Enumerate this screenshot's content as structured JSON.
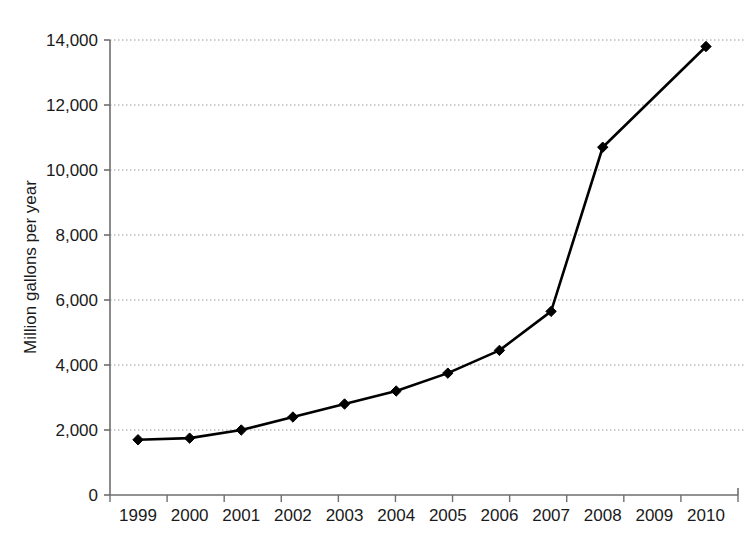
{
  "chart_data": {
    "type": "line",
    "title": "",
    "subtitle": "",
    "xlabel": "",
    "ylabel": "Million gallons per year",
    "categories": [
      "1999",
      "2000",
      "2001",
      "2002",
      "2003",
      "2004",
      "2005",
      "2006",
      "2007",
      "2008",
      "2009",
      "2010"
    ],
    "values": [
      1700,
      1750,
      2000,
      2400,
      2800,
      3200,
      3750,
      4450,
      5650,
      10700,
      null,
      13800
    ],
    "series": [
      {
        "name": "Million gallons per year",
        "values": [
          1700,
          1750,
          2000,
          2400,
          2800,
          3200,
          3750,
          4450,
          5650,
          10700,
          null,
          13800
        ]
      }
    ],
    "ylim": [
      0,
      14000
    ],
    "yticks": [
      0,
      2000,
      4000,
      6000,
      8000,
      10000,
      12000,
      14000
    ],
    "ytick_labels": [
      "0",
      "2,000",
      "4,000",
      "6,000",
      "8,000",
      "10,000",
      "12,000",
      "14,000"
    ],
    "xticks": [
      "1999",
      "2000",
      "2001",
      "2002",
      "2003",
      "2004",
      "2005",
      "2006",
      "2007",
      "2008",
      "2009",
      "2010"
    ],
    "grid": true,
    "grid_axis": "y",
    "grid_style": "dotted",
    "legend": false,
    "legend_position": "none",
    "marker": "diamond",
    "colors": {
      "line": "#000000",
      "marker": "#000000",
      "grid": "#999999",
      "axis": "#6e6e6e",
      "text": "#1a1a1a",
      "background": "#ffffff"
    }
  },
  "axes": {
    "y_axis_label": "Million gallons per year",
    "y_tick_labels": [
      "14,000",
      "12,000",
      "10,000",
      "8,000",
      "6,000",
      "4,000",
      "2,000",
      "0"
    ],
    "x_tick_labels": [
      "1999",
      "2000",
      "2001",
      "2002",
      "2003",
      "2004",
      "2005",
      "2006",
      "2007",
      "2008",
      "2009",
      "2010"
    ]
  }
}
